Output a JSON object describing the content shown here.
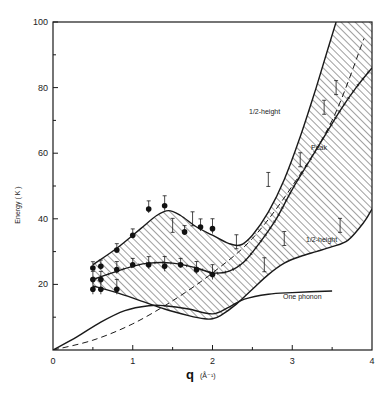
{
  "chart_data": {
    "type": "line",
    "title": "",
    "xlabel": "q",
    "xlabel_unit": "(Å⁻¹)",
    "ylabel": "Energy ( K )",
    "xlim": [
      0,
      4
    ],
    "ylim": [
      0,
      100
    ],
    "x_ticks": [
      0,
      1,
      2,
      3,
      4
    ],
    "x_tick_labels": [
      "0",
      "1",
      "2",
      "3",
      "4"
    ],
    "y_ticks": [
      20,
      40,
      60,
      80,
      100
    ],
    "y_tick_labels": [
      "20",
      "40",
      "60",
      "80",
      "100"
    ],
    "grid": false,
    "legend": null,
    "annotations": [
      {
        "text": "1/2-height",
        "x": 2.95,
        "y": 64
      },
      {
        "text": "Peak",
        "x": 3.1,
        "y": 53
      },
      {
        "text": "1/2-height",
        "x": 3.25,
        "y": 31
      },
      {
        "text": "One phonon",
        "x": 3.0,
        "y": 14
      }
    ],
    "series": [
      {
        "name": "Upper 1/2-height",
        "style": "solid",
        "x": [
          0.5,
          0.8,
          1.1,
          1.3,
          1.45,
          1.6,
          1.8,
          2.0,
          2.2,
          2.35,
          2.5,
          2.7,
          2.9,
          3.1,
          3.3,
          3.45,
          3.55
        ],
        "y": [
          26,
          31,
          37,
          41,
          42.5,
          41,
          37.5,
          35,
          32.5,
          32,
          35,
          42,
          52,
          65,
          80,
          92,
          100
        ]
      },
      {
        "name": "Peak",
        "style": "solid-with-dashes",
        "x": [
          0.5,
          0.8,
          1.0,
          1.2,
          1.5,
          1.8,
          2.0,
          2.2,
          2.4,
          2.6,
          2.8,
          3.0,
          3.2,
          3.4,
          3.6,
          3.8,
          4.0
        ],
        "y": [
          21.5,
          24,
          25.5,
          26.5,
          26.5,
          25,
          23.5,
          24,
          27,
          33,
          40,
          49,
          57,
          65,
          73,
          80,
          86
        ]
      },
      {
        "name": "Lower 1/2-height",
        "style": "solid",
        "x": [
          0.5,
          0.8,
          1.1,
          1.4,
          1.7,
          1.9,
          2.0,
          2.1,
          2.3,
          2.5,
          2.7,
          2.9,
          3.1,
          3.3,
          3.5,
          3.7,
          3.9,
          4.0
        ],
        "y": [
          19.5,
          17.5,
          15,
          12.5,
          10.5,
          9.5,
          9.5,
          10.5,
          14,
          18.5,
          23,
          26.5,
          28.5,
          30,
          31.5,
          33.5,
          39,
          43
        ]
      },
      {
        "name": "Dashed curve",
        "style": "dashed",
        "x": [
          0,
          0.5,
          1.0,
          1.5,
          2.0,
          2.5,
          3.0,
          3.5,
          3.9
        ],
        "y": [
          0,
          3,
          8,
          15,
          23.5,
          34,
          50,
          70,
          95
        ]
      },
      {
        "name": "One phonon",
        "style": "solid",
        "x": [
          0,
          0.3,
          0.6,
          0.9,
          1.2,
          1.4,
          1.7,
          2.0,
          2.2,
          2.4,
          2.7,
          3.0,
          3.5
        ],
        "y": [
          0,
          4,
          8.5,
          12,
          13.5,
          13.5,
          12.5,
          11,
          13,
          15.5,
          17,
          17.5,
          18
        ]
      },
      {
        "name": "Data: peak (filled circles)",
        "style": "markers",
        "x": [
          0.5,
          0.5,
          0.5,
          0.6,
          0.6,
          0.6,
          0.8,
          0.8,
          0.8,
          1.0,
          1.2,
          1.4,
          1.65,
          1.85,
          2.0
        ],
        "y": [
          25,
          21.5,
          18.5,
          25.5,
          21.5,
          18.5,
          30.5,
          24.5,
          18.5,
          35,
          43,
          44,
          36,
          37.5,
          37
        ]
      },
      {
        "name": "Data: lower band points",
        "style": "markers",
        "x": [
          1.0,
          1.2,
          1.4,
          1.6,
          1.8,
          2.0
        ],
        "y": [
          26,
          26,
          25.5,
          26,
          24.5,
          23
        ]
      }
    ]
  },
  "axes": {
    "y_label": "Energy ( K )",
    "x_label": "q",
    "x_unit": "(Å⁻¹)",
    "origin_label": "0"
  },
  "labels": {
    "upper_half": "1/2-height",
    "peak": "Peak",
    "lower_half": "1/2-height",
    "one_phonon": "One phonon"
  },
  "colors": {
    "ink": "#1a1a1a",
    "background": "#ffffff"
  }
}
